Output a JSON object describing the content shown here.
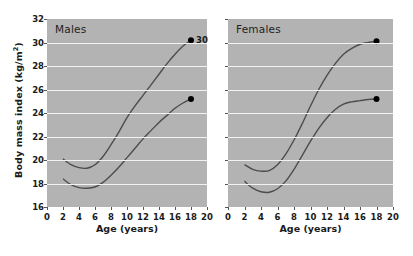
{
  "figure": {
    "y_axis_title_main": "Body mass index (kg/m",
    "y_axis_title_sup": "2",
    "y_axis_title_close": ")"
  },
  "chart_data": {
    "type": "line",
    "title": "",
    "xlabel": "Age (years)",
    "ylabel": "Body mass index (kg/m2)",
    "xlim": [
      0,
      20
    ],
    "ylim": [
      16,
      32
    ],
    "xticks": [
      0,
      2,
      4,
      6,
      8,
      10,
      12,
      14,
      16,
      18,
      20
    ],
    "yticks": [
      16,
      18,
      20,
      22,
      24,
      26,
      28,
      30,
      32
    ],
    "grid": "horizontal",
    "legend": "none",
    "panels": [
      {
        "label": "Males",
        "series": [
          {
            "name": "upper-centile-males",
            "endpoint_label": "30",
            "endpoint": {
              "x": 18,
              "y": 30.2
            },
            "x": [
              2,
              3,
              4,
              5,
              6,
              7,
              8,
              9,
              10,
              11,
              12,
              13,
              14,
              15,
              16,
              17,
              18
            ],
            "y": [
              20.1,
              19.6,
              19.35,
              19.3,
              19.6,
              20.3,
              21.3,
              22.4,
              23.6,
              24.6,
              25.5,
              26.4,
              27.3,
              28.2,
              29.0,
              29.7,
              30.2
            ]
          },
          {
            "name": "lower-centile-males",
            "endpoint_label": "",
            "endpoint": {
              "x": 18,
              "y": 25.2
            },
            "x": [
              2,
              3,
              4,
              5,
              6,
              7,
              8,
              9,
              10,
              11,
              12,
              13,
              14,
              15,
              16,
              17,
              18
            ],
            "y": [
              18.4,
              17.9,
              17.65,
              17.6,
              17.7,
              18.1,
              18.7,
              19.4,
              20.2,
              21.0,
              21.8,
              22.5,
              23.2,
              23.8,
              24.4,
              24.85,
              25.2
            ]
          }
        ]
      },
      {
        "label": "Females",
        "series": [
          {
            "name": "upper-centile-females",
            "endpoint_label": "",
            "endpoint": {
              "x": 18,
              "y": 30.1
            },
            "x": [
              2,
              3,
              4,
              5,
              6,
              7,
              8,
              9,
              10,
              11,
              12,
              13,
              14,
              15,
              16,
              17,
              18
            ],
            "y": [
              19.6,
              19.2,
              19.05,
              19.1,
              19.6,
              20.5,
              21.7,
              23.1,
              24.6,
              26.0,
              27.2,
              28.2,
              29.0,
              29.5,
              29.85,
              30.0,
              30.1
            ]
          },
          {
            "name": "lower-centile-females",
            "endpoint_label": "",
            "endpoint": {
              "x": 18,
              "y": 25.2
            },
            "x": [
              2,
              3,
              4,
              5,
              6,
              7,
              8,
              9,
              10,
              11,
              12,
              13,
              14,
              15,
              16,
              17,
              18
            ],
            "y": [
              18.2,
              17.6,
              17.3,
              17.25,
              17.55,
              18.2,
              19.2,
              20.4,
              21.6,
              22.7,
              23.6,
              24.3,
              24.75,
              24.95,
              25.05,
              25.15,
              25.2
            ]
          }
        ]
      }
    ]
  },
  "colors": {
    "plot_background": "#b3b3b3",
    "gridline": "#f2f2f2",
    "curve": "#4d4d4d",
    "marker": "#000000",
    "text": "#1a1a1a",
    "page_background": "#ffffff"
  }
}
